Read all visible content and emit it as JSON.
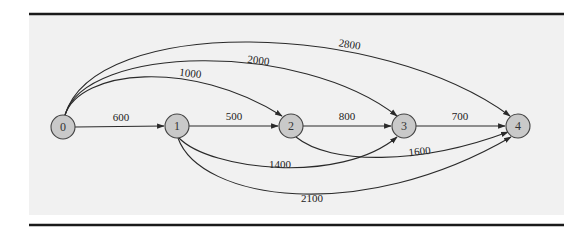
{
  "diagram": {
    "type": "directed-network",
    "colors": {
      "panel": "#f1f1f1",
      "rule": "#1a1a1a",
      "node_fill": "#c9c9c9",
      "node_stroke": "#444444",
      "edge": "#2a2a2a"
    },
    "nodes": [
      {
        "id": "0",
        "label": "0",
        "x": 63,
        "y": 127
      },
      {
        "id": "1",
        "label": "1",
        "x": 177,
        "y": 126
      },
      {
        "id": "2",
        "label": "2",
        "x": 291,
        "y": 126
      },
      {
        "id": "3",
        "label": "3",
        "x": 404,
        "y": 126
      },
      {
        "id": "4",
        "label": "4",
        "x": 518,
        "y": 126
      }
    ],
    "edges": [
      {
        "from": "0",
        "to": "1",
        "label": "600"
      },
      {
        "from": "1",
        "to": "2",
        "label": "500"
      },
      {
        "from": "2",
        "to": "3",
        "label": "800"
      },
      {
        "from": "3",
        "to": "4",
        "label": "700"
      },
      {
        "from": "0",
        "to": "2",
        "label": "1000"
      },
      {
        "from": "0",
        "to": "3",
        "label": "2000"
      },
      {
        "from": "0",
        "to": "4",
        "label": "2800"
      },
      {
        "from": "1",
        "to": "3",
        "label": "1400"
      },
      {
        "from": "1",
        "to": "4",
        "label": "2100"
      },
      {
        "from": "2",
        "to": "4",
        "label": "1600"
      }
    ]
  }
}
